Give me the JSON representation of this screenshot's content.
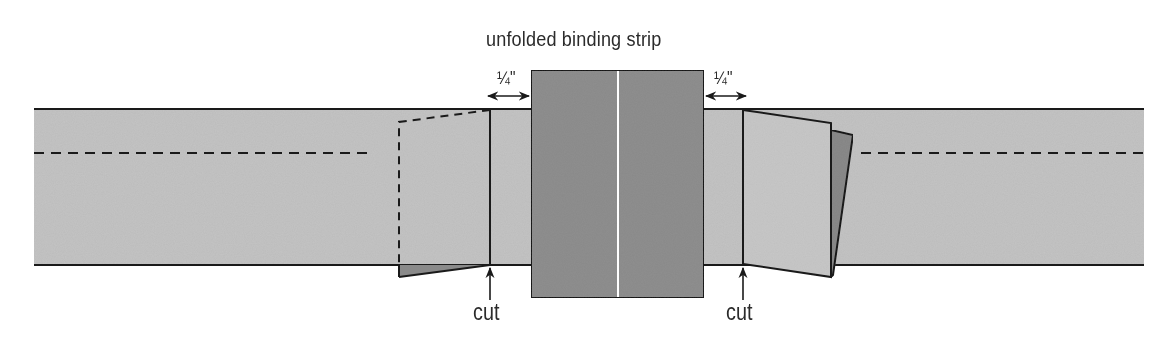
{
  "diagram": {
    "title": "unfolded binding strip",
    "measurements": [
      {
        "label": "1/4\"",
        "display": "¼\"",
        "side": "left"
      },
      {
        "label": "1/4\"",
        "display": "¼\"",
        "side": "right"
      }
    ],
    "cut_labels": [
      "cut",
      "cut"
    ],
    "colors": {
      "quilt_band": "#c4c4c4",
      "binding_strip": "#8f8f8f",
      "flap_back": "#8a8a8a",
      "flap_light": "#c8c8c8",
      "outline": "#1a1a1a",
      "fold_line": "#ffffff",
      "text": "#2b2b2b"
    }
  }
}
